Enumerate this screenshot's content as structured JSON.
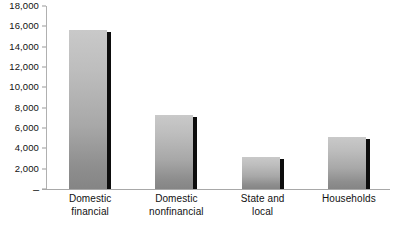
{
  "chart_data": {
    "type": "bar",
    "title": "",
    "subtitle": "",
    "xlabel": "",
    "ylabel": "",
    "categories": [
      "Domestic financial",
      "Domestic nonfinancial",
      "State and local",
      "Households"
    ],
    "category_lines": [
      [
        "Domestic",
        "financial"
      ],
      [
        "Domestic",
        "nonfinancial"
      ],
      [
        "State and",
        "local"
      ],
      [
        "Households"
      ]
    ],
    "values": [
      15650,
      7250,
      3150,
      5100
    ],
    "ylim": [
      0,
      18000
    ],
    "ytick_values": [
      0,
      2000,
      4000,
      6000,
      8000,
      10000,
      12000,
      14000,
      16000,
      18000
    ],
    "ytick_labels": [
      "–",
      "2,000",
      "4,000",
      "6,000",
      "8,000",
      "10,000",
      "12,000",
      "14,000",
      "16,000",
      "18,000"
    ],
    "grid": false,
    "legend": null,
    "legend_position": "none",
    "bar_fill_light": "#c9c9c9",
    "bar_fill_dark": "#858585",
    "bar_edge_color": "#0d0d0d",
    "axis_color": "#a8a8a8",
    "background_color": "#ffffff",
    "text_color": "#111111"
  }
}
